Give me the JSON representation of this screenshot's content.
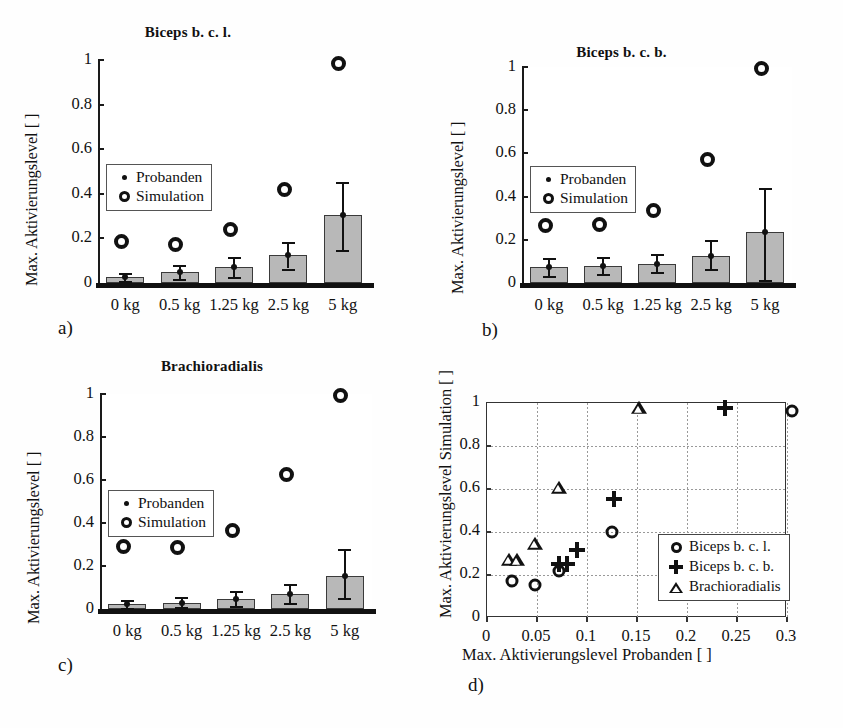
{
  "figure": {
    "panels": [
      "a)",
      "b)",
      "c)",
      "d)"
    ]
  },
  "common": {
    "ylabel": "Max. Aktivierungslevel [ ]",
    "ytick_labels": [
      "0",
      "0.2",
      "0.4",
      "0.6",
      "0.8",
      "1"
    ],
    "xtick_labels": [
      "0 kg",
      "0.5 kg",
      "1.25 kg",
      "2.5 kg",
      "5 kg"
    ],
    "legend": {
      "probanden": "Probanden",
      "simulation": "Simulation",
      "probanden_icon": "small-dot-marker",
      "simulation_icon": "open-circle-marker"
    }
  },
  "chart_data": [
    {
      "type": "bar",
      "panel": "a)",
      "title": "Biceps b. c. l.",
      "xlabel": "",
      "ylabel": "Max. Aktivierungslevel [ ]",
      "categories": [
        "0 kg",
        "0.5 kg",
        "1.25 kg",
        "2.5 kg",
        "5 kg"
      ],
      "ylim": [
        0,
        1
      ],
      "yticks": [
        0,
        0.2,
        0.4,
        0.6,
        0.8,
        1
      ],
      "grid": false,
      "legend_position": "upper-left",
      "series": [
        {
          "name": "Probanden",
          "marker": "bar-with-errorbar",
          "values": [
            0.025,
            0.048,
            0.072,
            0.125,
            0.305
          ],
          "err_low": [
            0.008,
            0.018,
            0.025,
            0.065,
            0.148
          ],
          "err_high": [
            0.045,
            0.082,
            0.115,
            0.185,
            0.455
          ]
        },
        {
          "name": "Simulation",
          "marker": "open-circle",
          "values": [
            0.17,
            0.155,
            0.22,
            0.4,
            0.965
          ]
        }
      ]
    },
    {
      "type": "bar",
      "panel": "b)",
      "title": "Biceps b. c. b.",
      "xlabel": "",
      "ylabel": "Max. Aktivierungslevel [ ]",
      "categories": [
        "0 kg",
        "0.5 kg",
        "1.25 kg",
        "2.5 kg",
        "5 kg"
      ],
      "ylim": [
        0,
        1
      ],
      "yticks": [
        0,
        0.2,
        0.4,
        0.6,
        0.8,
        1
      ],
      "grid": false,
      "legend_position": "upper-left",
      "series": [
        {
          "name": "Probanden",
          "marker": "bar-with-errorbar",
          "values": [
            0.072,
            0.08,
            0.09,
            0.127,
            0.238
          ],
          "err_low": [
            0.032,
            0.042,
            0.052,
            0.063,
            0.012
          ],
          "err_high": [
            0.118,
            0.122,
            0.132,
            0.198,
            0.44
          ]
        },
        {
          "name": "Simulation",
          "marker": "open-circle",
          "values": [
            0.25,
            0.252,
            0.315,
            0.555,
            0.975
          ]
        }
      ]
    },
    {
      "type": "bar",
      "panel": "c)",
      "title": "Brachioradialis",
      "xlabel": "",
      "ylabel": "Max. Aktivierungslevel [ ]",
      "categories": [
        "0 kg",
        "0.5 kg",
        "1.25 kg",
        "2.5 kg",
        "5 kg"
      ],
      "ylim": [
        0,
        1
      ],
      "yticks": [
        0,
        0.2,
        0.4,
        0.6,
        0.8,
        1
      ],
      "grid": false,
      "legend_position": "upper-left",
      "series": [
        {
          "name": "Probanden",
          "marker": "bar-with-errorbar",
          "values": [
            0.022,
            0.03,
            0.048,
            0.072,
            0.152
          ],
          "err_low": [
            0.004,
            0.008,
            0.015,
            0.03,
            0.05
          ],
          "err_high": [
            0.04,
            0.058,
            0.085,
            0.118,
            0.28
          ]
        },
        {
          "name": "Simulation",
          "marker": "open-circle",
          "values": [
            0.27,
            0.268,
            0.345,
            0.605,
            0.975
          ]
        }
      ]
    },
    {
      "type": "scatter",
      "panel": "d)",
      "title": "",
      "xlabel": "Max. Aktivierungslevel Probanden [ ]",
      "ylabel": "Max. Aktivierungslevel Simulation [ ]",
      "xlim": [
        0,
        0.3
      ],
      "ylim": [
        0,
        1
      ],
      "xticks": [
        0,
        0.05,
        0.1,
        0.15,
        0.2,
        0.25,
        0.3
      ],
      "xtick_labels": [
        "0",
        "0.05",
        "0.1",
        "0.15",
        "0.2",
        "0.25",
        "0.3"
      ],
      "yticks": [
        0,
        0.2,
        0.4,
        0.6,
        0.8,
        1
      ],
      "ytick_labels": [
        "0",
        "0.2",
        "0.4",
        "0.6",
        "0.8",
        "1"
      ],
      "grid": true,
      "legend_position": "lower-right",
      "series": [
        {
          "name": "Biceps b. c. l.",
          "marker": "open-circle",
          "points": [
            {
              "x": 0.025,
              "y": 0.17
            },
            {
              "x": 0.048,
              "y": 0.155
            },
            {
              "x": 0.072,
              "y": 0.22
            },
            {
              "x": 0.125,
              "y": 0.4
            },
            {
              "x": 0.305,
              "y": 0.965
            }
          ]
        },
        {
          "name": "Biceps b. c. b.",
          "marker": "plus",
          "points": [
            {
              "x": 0.072,
              "y": 0.25
            },
            {
              "x": 0.08,
              "y": 0.252
            },
            {
              "x": 0.09,
              "y": 0.315
            },
            {
              "x": 0.127,
              "y": 0.555
            },
            {
              "x": 0.238,
              "y": 0.975
            }
          ]
        },
        {
          "name": "Brachioradialis",
          "marker": "triangle",
          "points": [
            {
              "x": 0.022,
              "y": 0.27
            },
            {
              "x": 0.03,
              "y": 0.268
            },
            {
              "x": 0.048,
              "y": 0.345
            },
            {
              "x": 0.072,
              "y": 0.605
            },
            {
              "x": 0.152,
              "y": 0.975
            }
          ]
        }
      ]
    }
  ]
}
